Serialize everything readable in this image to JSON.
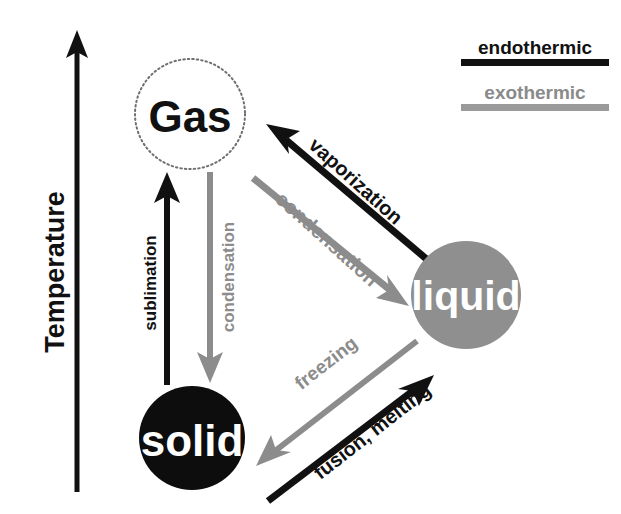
{
  "diagram": {
    "background_color": "#ffffff",
    "endothermic_color": "#111111",
    "exothermic_color": "#8c8c8c",
    "axis": {
      "label": "Temperature",
      "direction": "up",
      "color": "#111111"
    },
    "legend": {
      "items": [
        {
          "label": "endothermic",
          "color": "#111111",
          "text_color": "#111111"
        },
        {
          "label": "exothermic",
          "color": "#9a9a9a",
          "text_color": "#8a8a8a"
        }
      ]
    },
    "states": [
      {
        "id": "gas",
        "label": "Gas",
        "fill": "#ffffff",
        "stroke": "#7a7a7a",
        "stroke_style": "dotted",
        "text_color": "#111111",
        "font_size": 44,
        "cx": 190,
        "cy": 114,
        "rx": 55,
        "ry": 55
      },
      {
        "id": "solid",
        "label": "solid",
        "fill": "#0d0d0d",
        "stroke": "none",
        "stroke_style": "none",
        "text_color": "#ffffff",
        "font_size": 44,
        "cx": 192,
        "cy": 438,
        "rx": 53,
        "ry": 52
      },
      {
        "id": "liquid",
        "label": "liquid",
        "fill": "#8f8f8f",
        "stroke": "none",
        "stroke_style": "none",
        "text_color": "#ffffff",
        "font_size": 41,
        "cx": 466,
        "cy": 295,
        "rx": 55,
        "ry": 54
      }
    ],
    "transitions": [
      {
        "id": "sublimation",
        "label": "sublimation",
        "from": "solid",
        "to": "gas",
        "type": "endothermic",
        "color": "#111111",
        "font_size": 17,
        "label_x": 150,
        "label_y": 283,
        "label_rotate": -90
      },
      {
        "id": "deposition-condensation",
        "label": "condensation",
        "from": "gas",
        "to": "solid",
        "type": "exothermic",
        "color": "#8c8c8c",
        "font_size": 17,
        "label_x": 218,
        "label_y": 277,
        "label_rotate": -90
      },
      {
        "id": "vaporization",
        "label": "vaporization",
        "from": "liquid",
        "to": "gas",
        "type": "endothermic",
        "color": "#111111",
        "font_size": 19,
        "label_x": 354,
        "label_y": 180,
        "label_rotate": 42
      },
      {
        "id": "condensation",
        "label": "condensation",
        "from": "gas",
        "to": "liquid",
        "type": "exothermic",
        "color": "#8c8c8c",
        "font_size": 19,
        "label_x": 328,
        "label_y": 234,
        "label_rotate": 42
      },
      {
        "id": "freezing",
        "label": "freezing",
        "from": "liquid",
        "to": "solid",
        "type": "exothermic",
        "color": "#8c8c8c",
        "font_size": 18,
        "label_x": 323,
        "label_y": 364,
        "label_rotate": -42
      },
      {
        "id": "fusion-melting",
        "label": "fusion, melting",
        "from": "solid",
        "to": "liquid",
        "type": "endothermic",
        "color": "#111111",
        "font_size": 19,
        "label_x": 369,
        "label_y": 428,
        "label_rotate": -42
      }
    ]
  }
}
